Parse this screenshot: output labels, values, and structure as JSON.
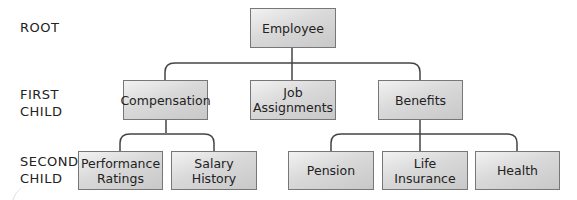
{
  "level_labels": {
    "root": "ROOT",
    "first_child": "FIRST\nCHILD",
    "second_child": "SECOND\nCHILD"
  },
  "nodes": {
    "root": {
      "label": "Employee"
    },
    "first": [
      {
        "label": "Compensation"
      },
      {
        "label": "Job\nAssignments"
      },
      {
        "label": "Benefits"
      }
    ],
    "second": [
      {
        "label": "Performance\nRatings",
        "parent": "Compensation"
      },
      {
        "label": "Salary\nHistory",
        "parent": "Compensation"
      },
      {
        "label": "Pension",
        "parent": "Benefits"
      },
      {
        "label": "Life\nInsurance",
        "parent": "Benefits"
      },
      {
        "label": "Health",
        "parent": "Benefits"
      }
    ]
  },
  "colors": {
    "line": "#444444",
    "box_border": "#777777"
  }
}
